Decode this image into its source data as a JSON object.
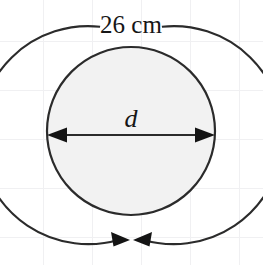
{
  "figure": {
    "kind": "geometry-diagram",
    "labels": {
      "circumference": "26 cm",
      "diameter": "d"
    },
    "colors": {
      "background": "#ffffff",
      "grid": "#f0f0f2",
      "stroke": "#2b2b2b",
      "arrow_fill": "#141414",
      "inner_fill": "#f2f2f2",
      "text": "#161616"
    },
    "geometry": {
      "center_x": 131,
      "center_y": 131,
      "outer_radius": 109,
      "inner_radius": 84,
      "diameter_line_y": 135,
      "outer_gap_top_degrees": 46,
      "outer_gap_bottom_degrees": 12
    }
  }
}
